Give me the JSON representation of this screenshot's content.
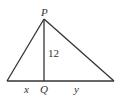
{
  "diagram": {
    "type": "triangle-with-altitude",
    "vertices": {
      "apex": {
        "label": "P"
      },
      "foot": {
        "label": "Q"
      }
    },
    "altitude_label": "12",
    "base_left_label": "x",
    "base_right_label": "y",
    "stroke_color": "#333333"
  }
}
